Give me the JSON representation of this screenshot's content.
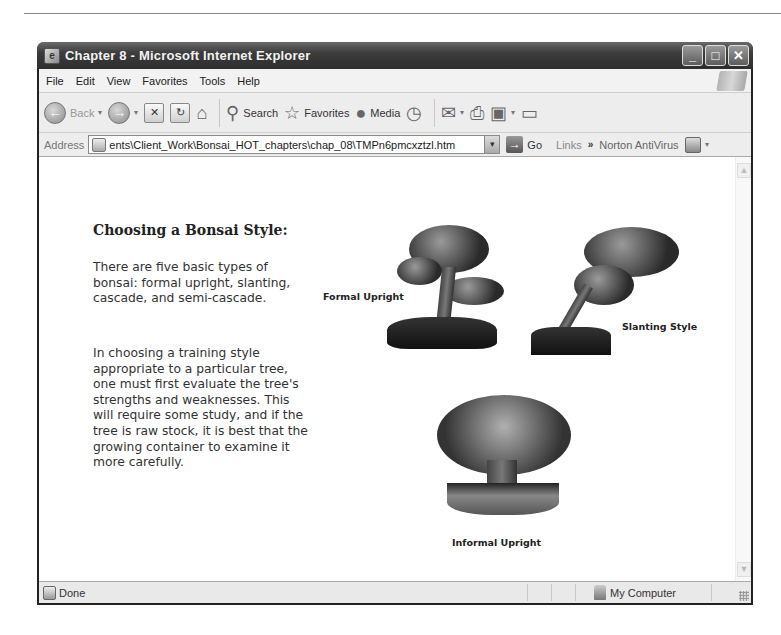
{
  "window": {
    "title": "Chapter 8 - Microsoft Internet Explorer",
    "controls": {
      "minimize": "_",
      "maximize": "□",
      "close": "✕"
    }
  },
  "menu": {
    "items": [
      {
        "label": "File"
      },
      {
        "label": "Edit"
      },
      {
        "label": "View"
      },
      {
        "label": "Favorites"
      },
      {
        "label": "Tools"
      },
      {
        "label": "Help"
      }
    ]
  },
  "toolbar": {
    "back_label": "Back",
    "search_label": "Search",
    "favorites_label": "Favorites",
    "media_label": "Media",
    "icons": {
      "back": "back-arrow-icon",
      "forward": "forward-arrow-icon",
      "stop": "stop-icon",
      "refresh": "refresh-icon",
      "home": "home-icon",
      "search": "search-icon",
      "favorites": "star-icon",
      "media": "media-icon",
      "history": "history-icon",
      "mail": "mail-icon",
      "print": "print-icon",
      "edit": "edit-icon",
      "discuss": "discuss-icon"
    },
    "glyphs": {
      "back": "←",
      "forward": "→",
      "stop": "✕",
      "refresh": "↻",
      "home": "⌂",
      "search": "⚲",
      "favorites": "☆",
      "media": "●",
      "history": "◷",
      "mail": "✉",
      "print": "⎙",
      "edit": "▣",
      "discuss": "▭",
      "dropdown": "▾"
    }
  },
  "address": {
    "label": "Address",
    "value": "ents\\Client_Work\\Bonsai_HOT_chapters\\chap_08\\TMPn6pmcxztzl.htm",
    "dropdown": "▾",
    "go_label": "Go",
    "go_glyph": "→",
    "links_label": "Links",
    "chevron": "»",
    "norton_label": "Norton AntiVirus"
  },
  "page": {
    "heading": "Choosing a Bonsai Style:",
    "paragraph1": "There are five basic types of bonsai: formal upright, slanting, cascade, and semi-cascade.",
    "paragraph2": "In choosing a training style appropriate to a particular tree, one must first evaluate the tree's strengths and weaknesses. This will require some study, and if the tree is raw stock, it is best that the growing container to examine it more carefully.",
    "images": [
      {
        "caption": "Formal Upright"
      },
      {
        "caption": "Slanting Style"
      },
      {
        "caption": "Informal Upright"
      }
    ]
  },
  "scrollbar": {
    "up": "▲",
    "down": "▼"
  },
  "status": {
    "text": "Done",
    "zone": "My Computer"
  }
}
